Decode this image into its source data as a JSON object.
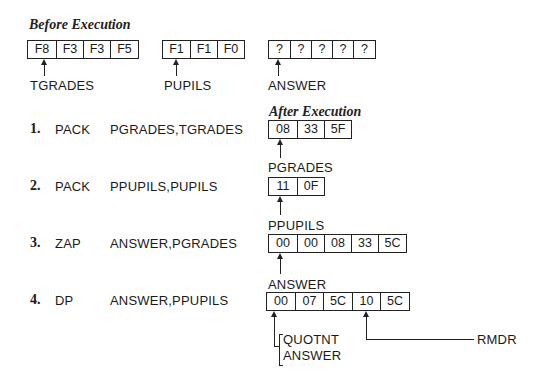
{
  "before": {
    "heading": "Before Execution",
    "fields": [
      {
        "name": "TGRADES",
        "bytes": [
          "F8",
          "F3",
          "F3",
          "F5"
        ]
      },
      {
        "name": "PUPILS",
        "bytes": [
          "F1",
          "F1",
          "F0"
        ]
      },
      {
        "name": "ANSWER",
        "bytes": [
          "?",
          "?",
          "?",
          "?",
          "?"
        ]
      }
    ]
  },
  "after": {
    "heading": "After Execution"
  },
  "steps": [
    {
      "num": "1.",
      "op": "PACK",
      "operands": "PGRADES,TGRADES",
      "result_label": "PGRADES",
      "result": [
        "08",
        "33",
        "5F"
      ]
    },
    {
      "num": "2.",
      "op": "PACK",
      "operands": "PPUPILS,PUPILS",
      "result_label": "PPUPILS",
      "result": [
        "11",
        "0F"
      ]
    },
    {
      "num": "3.",
      "op": "ZAP",
      "operands": "ANSWER,PGRADES",
      "result_label": "ANSWER",
      "result": [
        "00",
        "00",
        "08",
        "33",
        "5C"
      ]
    },
    {
      "num": "4.",
      "op": "DP",
      "operands": "ANSWER,PPUPILS",
      "result": [
        "00",
        "07",
        "5C",
        "10",
        "5C"
      ],
      "labels": {
        "quotient": "QUOTNT",
        "answer": "ANSWER",
        "remainder": "RMDR"
      }
    }
  ]
}
